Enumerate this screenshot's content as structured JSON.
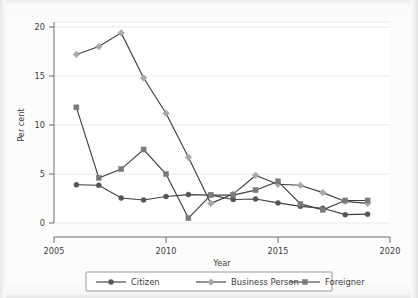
{
  "chart_data": {
    "type": "line",
    "title": "",
    "xlabel": "Year",
    "ylabel": "Per cent",
    "xlim": [
      2005,
      2020
    ],
    "ylim": [
      0,
      20
    ],
    "xticks": [
      "2005",
      "2010",
      "2015",
      "2020"
    ],
    "xtick_values": [
      2005,
      2010,
      2015,
      2020
    ],
    "yticks": [
      "0",
      "5",
      "10",
      "15",
      "20"
    ],
    "ytick_values": [
      0,
      5,
      10,
      15,
      20
    ],
    "grid": "horizontal",
    "legend_position": "below-axis-centered",
    "x": [
      2006,
      2007,
      2008,
      2009,
      2010,
      2011,
      2012,
      2013,
      2014,
      2015,
      2016,
      2017,
      2018,
      2019
    ],
    "series": [
      {
        "name": "Citizen",
        "marker": "circle",
        "color": "#555555",
        "values": [
          3.9,
          3.85,
          2.55,
          2.35,
          2.7,
          2.9,
          2.85,
          2.4,
          2.45,
          2.05,
          1.7,
          1.5,
          0.85,
          0.9
        ]
      },
      {
        "name": "Business Person",
        "marker": "diamond",
        "color": "#a8a8a8",
        "values": [
          17.2,
          18.0,
          19.4,
          14.8,
          11.2,
          6.7,
          2.0,
          2.95,
          4.85,
          3.95,
          3.85,
          3.1,
          2.2,
          2.0
        ]
      },
      {
        "name": "Foreigner",
        "marker": "square",
        "color": "#7a7a7a",
        "values": [
          11.8,
          4.6,
          5.5,
          7.5,
          5.0,
          0.5,
          2.85,
          2.85,
          3.35,
          4.25,
          1.95,
          1.35,
          2.3,
          2.3
        ]
      }
    ]
  },
  "legend": {
    "entries": [
      {
        "label": "Citizen"
      },
      {
        "label": "Business Person"
      },
      {
        "label": "Foreigner"
      }
    ]
  },
  "axes": {
    "y_title": "Per cent",
    "x_title": "Year"
  }
}
